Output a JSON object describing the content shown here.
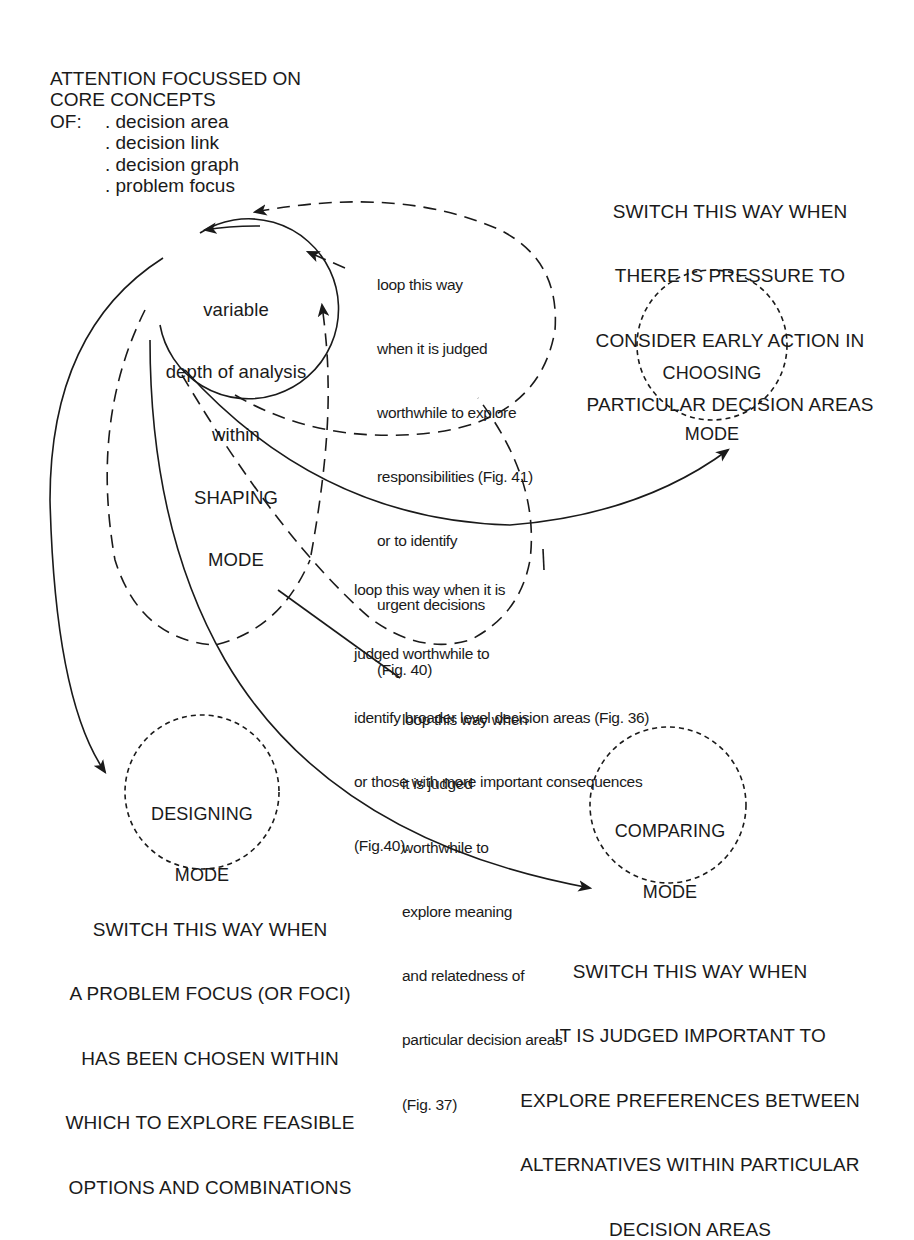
{
  "header": {
    "title_lines": [
      "ATTENTION FOCUSSED ON",
      "CORE CONCEPTS"
    ],
    "of_label": "OF:",
    "concepts": [
      ". decision area",
      ". decision link",
      ". decision graph",
      ". problem focus"
    ]
  },
  "nodes": {
    "shaping": {
      "lines": [
        "variable",
        "depth of analysis",
        "within",
        "SHAPING",
        "MODE"
      ]
    },
    "choosing": {
      "lines": [
        "CHOOSING",
        "MODE"
      ]
    },
    "designing": {
      "lines": [
        "DESIGNING",
        "MODE"
      ]
    },
    "comparing": {
      "lines": [
        "COMPARING",
        "MODE"
      ]
    }
  },
  "annotations": {
    "choosing_switch": {
      "lines": [
        "SWITCH THIS WAY WHEN",
        "THERE IS PRESSURE TO",
        "CONSIDER EARLY ACTION IN",
        "PARTICULAR DECISION AREAS"
      ]
    },
    "designing_switch": {
      "lines": [
        "SWITCH THIS WAY WHEN",
        "A PROBLEM FOCUS (OR FOCI)",
        "HAS BEEN CHOSEN WITHIN",
        "WHICH TO EXPLORE FEASIBLE",
        "OPTIONS AND COMBINATIONS"
      ]
    },
    "comparing_switch": {
      "lines": [
        "SWITCH THIS WAY WHEN",
        "IT IS JUDGED IMPORTANT TO",
        "EXPLORE PREFERENCES BETWEEN",
        "ALTERNATIVES WITHIN PARTICULAR",
        "DECISION AREAS"
      ]
    },
    "loop_responsibilities": {
      "lines": [
        "loop this way",
        "when it is judged",
        "worthwhile to explore",
        "responsibilities (Fig. 41)",
        "or to identify",
        "urgent decisions",
        "(Fig. 40)"
      ]
    },
    "loop_broader": {
      "lines": [
        "loop this way when it is",
        "judged worthwhile to",
        "identify broader level decision areas (Fig. 36)",
        "or those with more important consequences",
        "(Fig.40)."
      ]
    },
    "loop_meaning": {
      "lines": [
        "loop this way when",
        "it is judged",
        "worthwhile to",
        "explore meaning",
        "and relatedness of",
        "particular decision areas",
        "(Fig. 37)"
      ]
    }
  },
  "colors": {
    "ink": "#1a1a1a",
    "background": "#ffffff"
  }
}
